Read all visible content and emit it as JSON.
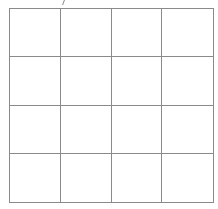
{
  "board": {
    "rows": 4,
    "columns": 4,
    "cells": [
      [
        "",
        "",
        "",
        ""
      ],
      [
        "",
        "",
        "",
        ""
      ],
      [
        "",
        "",
        "",
        ""
      ],
      [
        "",
        "",
        "",
        ""
      ]
    ],
    "line_color": "#8a8a8a",
    "background_color": "#ffffff"
  }
}
